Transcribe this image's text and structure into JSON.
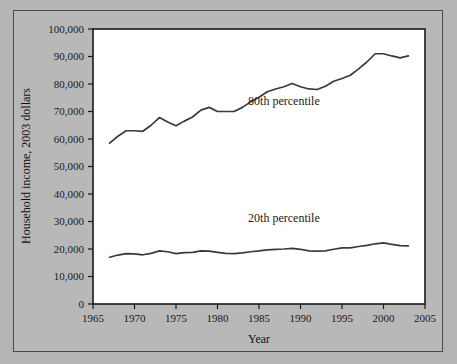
{
  "chart_data": {
    "type": "line",
    "title": "",
    "xlabel": "Year",
    "ylabel": "Household income, 2003 dollars",
    "xlim": [
      1965,
      2005
    ],
    "ylim": [
      0,
      100000
    ],
    "xticks": [
      1965,
      1970,
      1975,
      1980,
      1985,
      1990,
      1995,
      2000,
      2005
    ],
    "xtick_labels": [
      "1965",
      "1970",
      "1975",
      "1980",
      "1985",
      "1990",
      "1995",
      "2000",
      "2005"
    ],
    "yticks": [
      0,
      10000,
      20000,
      30000,
      40000,
      50000,
      60000,
      70000,
      80000,
      90000,
      100000
    ],
    "ytick_labels": [
      "0",
      "10,000",
      "20,000",
      "30,000",
      "40,000",
      "50,000",
      "60,000",
      "70,000",
      "80,000",
      "90,000",
      "100,000"
    ],
    "grid": false,
    "legend_position": "inline-annotation",
    "line_color": "#3a3a3a",
    "x": [
      1967,
      1968,
      1969,
      1970,
      1971,
      1972,
      1973,
      1974,
      1975,
      1976,
      1977,
      1978,
      1979,
      1980,
      1981,
      1982,
      1983,
      1984,
      1985,
      1986,
      1987,
      1988,
      1989,
      1990,
      1991,
      1992,
      1993,
      1994,
      1995,
      1996,
      1997,
      1998,
      1999,
      2000,
      2001,
      2002,
      2003
    ],
    "series": [
      {
        "name": "80th percentile",
        "annotation": "80th percentile",
        "annotation_x": 1988,
        "annotation_y": 72500,
        "values": [
          58500,
          61000,
          63000,
          63000,
          62800,
          65000,
          67800,
          66200,
          64800,
          66500,
          68000,
          70500,
          71500,
          70000,
          70000,
          70000,
          71500,
          73500,
          75200,
          77200,
          78200,
          79000,
          80200,
          79000,
          78200,
          78000,
          79200,
          81000,
          82000,
          83200,
          85500,
          88000,
          91000,
          91000,
          90200,
          89500,
          90200
        ]
      },
      {
        "name": "20th percentile",
        "annotation": "20th percentile",
        "annotation_x": 1988,
        "annotation_y": 30000,
        "values": [
          17000,
          17800,
          18300,
          18200,
          17900,
          18400,
          19300,
          19000,
          18300,
          18700,
          18800,
          19300,
          19200,
          18800,
          18400,
          18300,
          18600,
          19000,
          19300,
          19700,
          19900,
          20000,
          20200,
          19900,
          19300,
          19200,
          19300,
          19900,
          20400,
          20400,
          20900,
          21300,
          21900,
          22200,
          21700,
          21200,
          21100
        ]
      }
    ]
  }
}
